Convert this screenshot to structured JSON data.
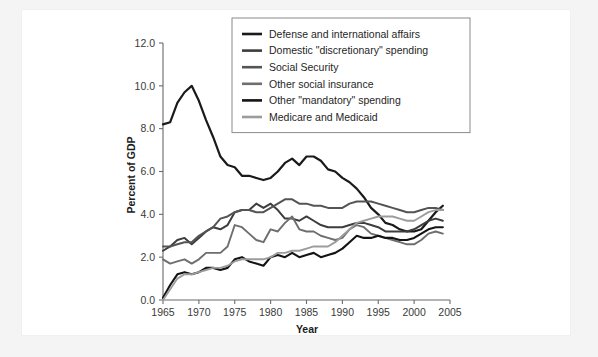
{
  "figure": {
    "background_color": "#f4f4f4",
    "card_color": "#ffffff"
  },
  "chart_data": {
    "type": "line",
    "title": "",
    "xlabel": "Year",
    "ylabel": "Percent of GDP",
    "xlim": [
      1965,
      2005
    ],
    "ylim": [
      0.0,
      12.0
    ],
    "xticks": [
      1965,
      1970,
      1975,
      1980,
      1985,
      1990,
      1995,
      2000,
      2005
    ],
    "xticklabels": [
      "1965",
      "1970",
      "1975",
      "1980",
      "1985",
      "1990",
      "1995",
      "2000",
      "2005"
    ],
    "yticks": [
      0.0,
      2.0,
      4.0,
      6.0,
      8.0,
      10.0,
      12.0
    ],
    "yticklabels": [
      "0.0",
      "2.0",
      "4.0",
      "6.0",
      "8.0",
      "10.0",
      "12.0"
    ],
    "grid": false,
    "legend_position": "upper center",
    "x": [
      1965,
      1966,
      1967,
      1968,
      1969,
      1970,
      1971,
      1972,
      1973,
      1974,
      1975,
      1976,
      1977,
      1978,
      1979,
      1980,
      1981,
      1982,
      1983,
      1984,
      1985,
      1986,
      1987,
      1988,
      1989,
      1990,
      1991,
      1992,
      1993,
      1994,
      1995,
      1996,
      1997,
      1998,
      1999,
      2000,
      2001,
      2002,
      2003,
      2004
    ],
    "series": [
      {
        "name": "Defense and international affairs",
        "color": "#1a1a1a",
        "width": 2.2,
        "values": [
          8.2,
          8.3,
          9.2,
          9.7,
          10.0,
          9.3,
          8.4,
          7.6,
          6.7,
          6.3,
          6.2,
          5.8,
          5.8,
          5.7,
          5.6,
          5.7,
          6.0,
          6.4,
          6.6,
          6.3,
          6.7,
          6.7,
          6.5,
          6.1,
          6.0,
          5.7,
          5.5,
          5.2,
          4.8,
          4.3,
          4.0,
          3.6,
          3.5,
          3.3,
          3.2,
          3.2,
          3.3,
          3.7,
          4.1,
          4.4
        ]
      },
      {
        "name": "Domestic \"discretionary\" spending",
        "color": "#3d3d3d",
        "width": 2.0,
        "values": [
          2.3,
          2.5,
          2.8,
          2.9,
          2.6,
          2.9,
          3.2,
          3.4,
          3.3,
          3.5,
          4.1,
          4.2,
          4.2,
          4.5,
          4.3,
          4.5,
          4.2,
          3.8,
          3.8,
          3.7,
          3.9,
          3.7,
          3.5,
          3.4,
          3.4,
          3.4,
          3.5,
          3.6,
          3.6,
          3.5,
          3.4,
          3.2,
          3.2,
          3.2,
          3.2,
          3.3,
          3.5,
          3.7,
          3.8,
          3.7
        ]
      },
      {
        "name": "Social Security",
        "color": "#545454",
        "width": 2.0,
        "values": [
          2.5,
          2.5,
          2.6,
          2.7,
          2.7,
          3.0,
          3.2,
          3.4,
          3.8,
          3.9,
          4.1,
          4.2,
          4.2,
          4.1,
          4.1,
          4.3,
          4.5,
          4.7,
          4.7,
          4.5,
          4.5,
          4.4,
          4.4,
          4.3,
          4.3,
          4.3,
          4.5,
          4.6,
          4.6,
          4.6,
          4.5,
          4.4,
          4.3,
          4.2,
          4.1,
          4.1,
          4.2,
          4.3,
          4.3,
          4.2
        ]
      },
      {
        "name": "Other social insurance",
        "color": "#6e6e6e",
        "width": 1.9,
        "values": [
          1.9,
          1.7,
          1.8,
          1.9,
          1.7,
          1.9,
          2.2,
          2.2,
          2.2,
          2.5,
          3.5,
          3.4,
          3.1,
          2.8,
          2.7,
          3.3,
          3.2,
          3.6,
          3.9,
          3.3,
          3.2,
          3.2,
          3.0,
          2.9,
          2.8,
          2.9,
          3.3,
          3.5,
          3.4,
          3.1,
          3.0,
          2.9,
          2.8,
          2.7,
          2.6,
          2.6,
          2.8,
          3.1,
          3.2,
          3.1
        ]
      },
      {
        "name": "Other \"mandatory\" spending",
        "color": "#141414",
        "width": 2.1,
        "values": [
          0.1,
          0.7,
          1.2,
          1.3,
          1.2,
          1.3,
          1.5,
          1.5,
          1.4,
          1.5,
          1.9,
          2.0,
          1.8,
          1.7,
          1.6,
          2.0,
          2.1,
          2.0,
          2.2,
          2.0,
          2.1,
          2.2,
          2.0,
          2.1,
          2.2,
          2.4,
          2.7,
          3.0,
          2.9,
          2.9,
          3.0,
          2.9,
          2.9,
          2.8,
          2.8,
          2.9,
          3.1,
          3.3,
          3.4,
          3.4
        ]
      },
      {
        "name": "Medicare and Medicaid",
        "color": "#9c9c9c",
        "width": 1.9,
        "values": [
          0.0,
          0.5,
          1.0,
          1.2,
          1.2,
          1.3,
          1.4,
          1.5,
          1.5,
          1.6,
          1.8,
          1.9,
          1.9,
          1.9,
          1.9,
          2.0,
          2.2,
          2.2,
          2.3,
          2.3,
          2.4,
          2.5,
          2.5,
          2.5,
          2.7,
          3.0,
          3.3,
          3.6,
          3.7,
          3.8,
          3.9,
          3.9,
          3.9,
          3.8,
          3.7,
          3.7,
          3.9,
          4.1,
          4.2,
          4.2
        ]
      }
    ]
  }
}
